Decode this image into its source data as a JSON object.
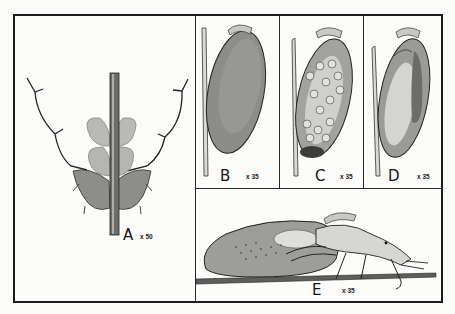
{
  "plate": {
    "figures": [
      {
        "id": "A",
        "label": "A",
        "magnification": "x 50",
        "subject": "stem with leaf bases and branching hairs"
      },
      {
        "id": "B",
        "label": "B",
        "magnification": "x 35",
        "subject": "egg on stem, stippled surface"
      },
      {
        "id": "C",
        "label": "C",
        "magnification": "x 35",
        "subject": "egg on stem with developing cells"
      },
      {
        "id": "D",
        "label": "D",
        "magnification": "x 35",
        "subject": "egg on stem with developing embryo"
      },
      {
        "id": "E",
        "label": "E",
        "magnification": "x 35",
        "subject": "hatching larva beside egg on stem"
      }
    ],
    "colors": {
      "ink": "#1c1c1c",
      "paper": "#fcfcfb",
      "shade": "#8a8a8a"
    }
  }
}
